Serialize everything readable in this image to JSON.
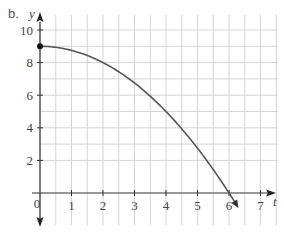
{
  "part_label": "b.",
  "chart_data": {
    "type": "line",
    "title": "",
    "xlabel": "t",
    "ylabel": "y",
    "xlim": [
      0,
      7.5
    ],
    "ylim": [
      -1.2,
      10.9
    ],
    "x_ticks": [
      1,
      2,
      3,
      4,
      5,
      6,
      7
    ],
    "y_ticks": [
      2,
      4,
      6,
      8,
      10
    ],
    "origin_label": "0",
    "grid": true,
    "grid_minor_x": 0.5,
    "grid_minor_y": 1,
    "series": [
      {
        "name": "y = 9 - 0.25t^2",
        "x": [
          0,
          0.5,
          1,
          1.5,
          2,
          2.5,
          3,
          3.5,
          4,
          4.5,
          5,
          5.5,
          6,
          6.3
        ],
        "values": [
          9,
          8.94,
          8.75,
          8.44,
          8,
          7.44,
          6.75,
          5.94,
          5,
          3.94,
          2.75,
          1.44,
          0,
          -0.92
        ],
        "start_point": [
          0,
          9
        ],
        "start_marker": "filled-circle",
        "end_marker": "arrow",
        "color": "#555555"
      }
    ],
    "colors": {
      "grid": "#d4d4d4",
      "axis": "#333333",
      "curve": "#555555",
      "text": "#444444"
    }
  }
}
